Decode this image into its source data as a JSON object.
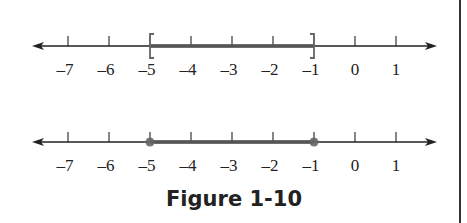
{
  "figure": {
    "caption": "Figure 1-10",
    "colors": {
      "axis": "#222222",
      "highlight": "#555555",
      "endpoint": "#666666",
      "text": "#222222"
    }
  },
  "chart_data": [
    {
      "type": "number-line",
      "title": "",
      "ticks": [
        -7,
        -6,
        -5,
        -4,
        -3,
        -2,
        -1,
        0,
        1
      ],
      "tick_labels": [
        "–7",
        "–6",
        "–5",
        "–4",
        "–3",
        "–2",
        "–1",
        "0",
        "1"
      ],
      "interval": {
        "start": -5,
        "end": -1,
        "left_closed": true,
        "right_closed": true
      },
      "endpoint_style": "brackets",
      "notation": "[-5, -1]"
    },
    {
      "type": "number-line",
      "title": "",
      "ticks": [
        -7,
        -6,
        -5,
        -4,
        -3,
        -2,
        -1,
        0,
        1
      ],
      "tick_labels": [
        "–7",
        "–6",
        "–5",
        "–4",
        "–3",
        "–2",
        "–1",
        "0",
        "1"
      ],
      "interval": {
        "start": -5,
        "end": -1,
        "left_closed": true,
        "right_closed": true
      },
      "endpoint_style": "filled-dots",
      "notation": "-5 ≤ x ≤ -1"
    }
  ],
  "axis_layout": {
    "x_start": 32,
    "x_end": 437,
    "unit_px": 41,
    "origin_value": -7,
    "origin_px": 68,
    "line1_y": 46,
    "line2_y": 142
  }
}
